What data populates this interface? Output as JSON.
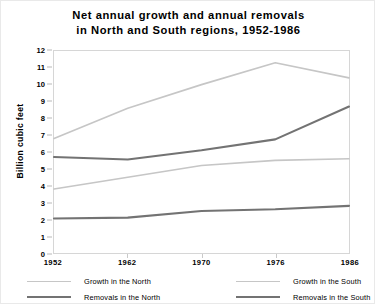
{
  "chart_data": {
    "type": "line",
    "title": "Net annual growth and annual removals\nin North and South regions, 1952-1986",
    "xlabel": "",
    "ylabel": "Billion cubic feet",
    "categories": [
      "1952",
      "1962",
      "1970",
      "1976",
      "1986"
    ],
    "ylim": [
      0,
      12
    ],
    "yticks": [
      "0",
      "1",
      "2",
      "3",
      "4",
      "5",
      "6",
      "7",
      "8",
      "9",
      "10",
      "11",
      "12"
    ],
    "grid": false,
    "legend_position": "bottom",
    "series": [
      {
        "name": "Growth in the North",
        "color": "#c6c6c6",
        "values": [
          3.8,
          4.5,
          5.2,
          5.5,
          5.6
        ]
      },
      {
        "name": "Growth in the South",
        "color": "#c6c6c6",
        "values": [
          6.8,
          8.6,
          10.0,
          11.3,
          10.4
        ]
      },
      {
        "name": "Removals in the North",
        "color": "#737373",
        "values": [
          2.05,
          2.1,
          2.5,
          2.6,
          2.8
        ]
      },
      {
        "name": "Removals in the South",
        "color": "#737373",
        "values": [
          5.7,
          5.55,
          6.1,
          6.75,
          8.7
        ]
      }
    ]
  },
  "legend": [
    {
      "label": "Growth in the North",
      "color": "#c6c6c6",
      "weight": "thin"
    },
    {
      "label": "Growth in the South",
      "color": "#c6c6c6",
      "weight": "thin"
    },
    {
      "label": "Removals in the North",
      "color": "#737373",
      "weight": "thick"
    },
    {
      "label": "Removals in the South",
      "color": "#737373",
      "weight": "thick"
    }
  ]
}
